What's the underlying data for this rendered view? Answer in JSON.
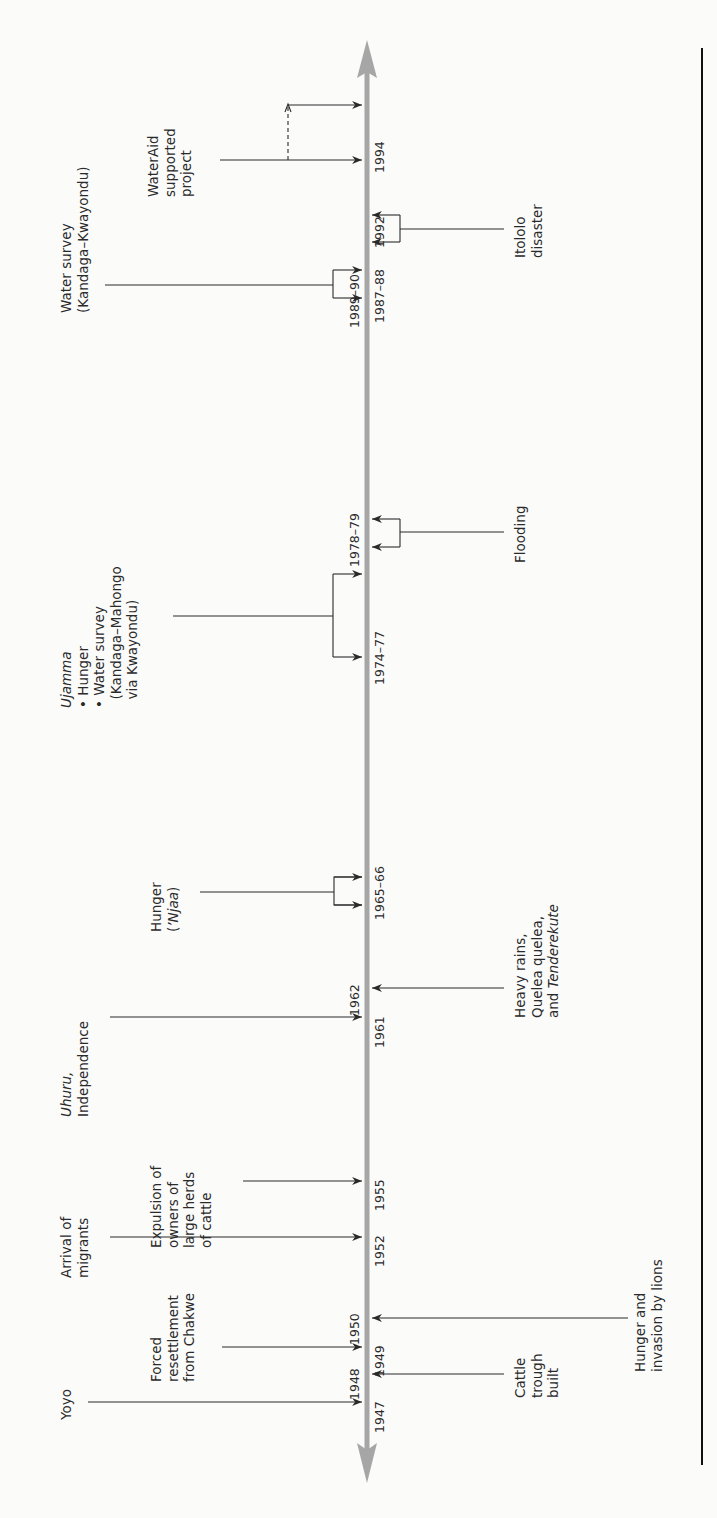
{
  "diagram": {
    "type": "timeline",
    "orientation": "vertical-rotated",
    "colors": {
      "axis": "#a6a6a6",
      "lines": "#2a2a2a",
      "rule": "#111111",
      "background": "#fbfbfa"
    },
    "events_above": [
      {
        "id": "yoyo",
        "label": "Yoyo",
        "years": [
          "1947"
        ]
      },
      {
        "id": "forced-resettlement",
        "label": "Forced\nresettlement\nfrom Chakwe",
        "years": [
          "1949"
        ]
      },
      {
        "id": "arrival-migrants",
        "label": "Arrival of\nmigrants",
        "years": [
          "1952"
        ]
      },
      {
        "id": "expulsion",
        "label": "Expulsion of\nowners of\nlarge herds\nof cattle",
        "years": [
          "1955"
        ]
      },
      {
        "id": "uhuru",
        "label_italic": "Uhuru,",
        "label": "Independence",
        "years": [
          "1961"
        ]
      },
      {
        "id": "hunger-njaa",
        "label": "Hunger",
        "label_paren": "(",
        "label_italic": "’Njaa",
        "label_close": ")",
        "years": [
          "1965–66"
        ]
      },
      {
        "id": "ujamma",
        "label_italic": "Ujamma",
        "bullets": [
          "• Hunger",
          "• Water survey",
          "  (Kandaga–Mahongo",
          "  via Kwayondu)"
        ],
        "years": [
          "1974–77"
        ]
      },
      {
        "id": "water-survey-kk",
        "label": "Water survey\n(Kandaga–Kwayondu)",
        "years": [
          "1987–88"
        ]
      },
      {
        "id": "wateraid",
        "label": "WaterAid\nsupported\nproject",
        "years": [
          "1992",
          "1994"
        ]
      }
    ],
    "events_below": [
      {
        "id": "cattle-trough",
        "label": "Cattle\ntrough\nbuilt",
        "years": [
          "1948"
        ]
      },
      {
        "id": "hunger-lions",
        "label": "Hunger and\ninvasion by lions",
        "years": [
          "1950"
        ]
      },
      {
        "id": "heavy-rains",
        "label_lines": [
          "Heavy rains,",
          "Quelea quelea,",
          "and "
        ],
        "label_italic": "Tenderekute",
        "years": [
          "1962"
        ]
      },
      {
        "id": "flooding",
        "label": "Flooding",
        "years": [
          "1978–79"
        ]
      },
      {
        "id": "itololo",
        "label": "Itololo\ndisaster",
        "years": [
          "1989–90"
        ]
      }
    ],
    "year_labels": {
      "y1947": "1947",
      "y1948": "1948",
      "y1949": "1949",
      "y1950": "1950",
      "y1952": "1952",
      "y1955": "1955",
      "y1961": "1961",
      "y1962": "1962",
      "y1965": "1965–66",
      "y1974": "1974–77",
      "y1978": "1978–79",
      "y1987": "1987–88",
      "y1989": "1989–90",
      "y1992": "1992",
      "y1994": "1994"
    }
  },
  "labels": {
    "yoyo": "Yoyo",
    "forced": "Forced\nresettlement\nfrom Chakwe",
    "arrival": "Arrival of\nmigrants",
    "expulsion": "Expulsion of\nowners of\nlarge herds\nof cattle",
    "uhuru_it": "Uhuru,",
    "uhuru": "Independence",
    "hunger": "Hunger",
    "njaa_open": "(",
    "njaa_it": "’Njaa",
    "njaa_close": ")",
    "ujamma_it": "Ujamma",
    "ujamma_bullets": "• Hunger\n• Water survey\n  (Kandaga–Mahongo\n  via Kwayondu)",
    "ws_kk": "Water survey\n(Kandaga–Kwayondu)",
    "wateraid": "WaterAid\nsupported\nproject",
    "cattle": "Cattle\ntrough\nbuilt",
    "lions": "Hunger and\ninvasion by lions",
    "rains": "Heavy rains,\nQuelea quelea,\nand ",
    "rains_it": "Tenderekute",
    "flooding": "Flooding",
    "itololo": "Itololo\ndisaster"
  }
}
